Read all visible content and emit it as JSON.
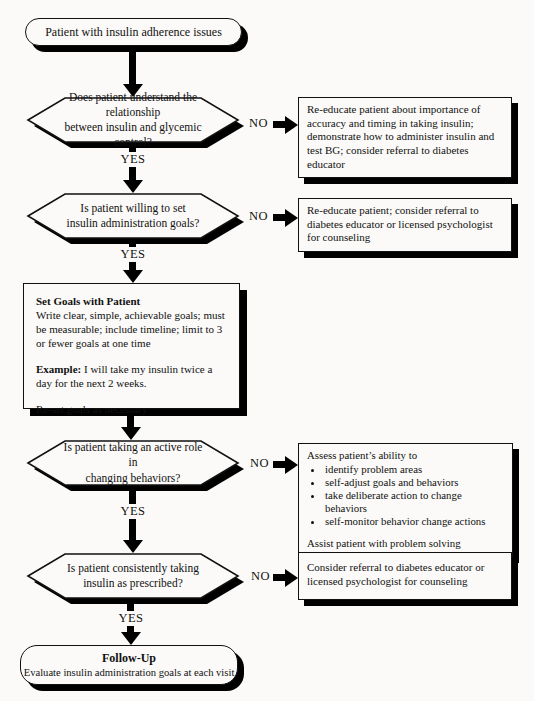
{
  "labels": {
    "yes": "YES",
    "no": "NO"
  },
  "nodes": {
    "start": "Patient with insulin adherence issues",
    "d1": "Does patient understand the relationship\nbetween insulin and glycemic control?",
    "d2": "Is patient willing to set\ninsulin administration goals?",
    "d3": "Is patient taking an active role in\nchanging behaviors?",
    "d4": "Is patient consistently taking\ninsulin as prescribed?",
    "goals": {
      "title": "Set Goals with Patient",
      "body": "Write clear, simple, achievable goals; must be measurable; include timeline; limit to 3 or fewer goals at one time",
      "example_label": "Example:",
      "example_text": " I will take my insulin twice a day for the next 2 weeks.",
      "footer": "Re-set goals as necessary"
    },
    "no1": "Re-educate patient about importance of accuracy and timing in taking insulin; demonstrate how to administer insulin and test BG; consider referral to diabetes educator",
    "no2": "Re-educate patient; consider referral to diabetes educator or licensed psychologist for counseling",
    "no3": {
      "intro": "Assess patient’s ability to",
      "bullets": [
        "identify problem areas",
        "self-adjust goals and behaviors",
        "take deliberate action to change behaviors",
        "self-monitor behavior change actions"
      ],
      "footer": "Assist patient with problem solving"
    },
    "no4": "Consider referral to diabetes educator or licensed psychologist for counseling",
    "end": {
      "title": "Follow-Up",
      "text": "Evaluate insulin administration goals at each visit"
    }
  }
}
